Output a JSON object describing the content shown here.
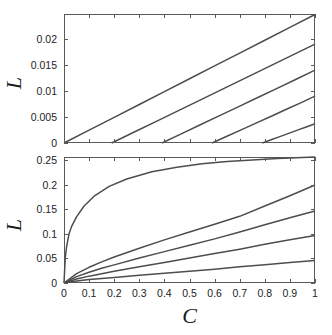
{
  "figure": {
    "title": "",
    "background_color": "#ffffff",
    "curve_color": "#4d4d4d",
    "axis_color": "#5a5a5a"
  },
  "panels": [
    {
      "id": "top",
      "ylabel": "L",
      "xlabel": "",
      "y_ticks": [
        "0",
        "0.005",
        "0.01",
        "0.015",
        "0.02"
      ],
      "x_ticks": [
        "",
        "",
        "",
        "",
        "",
        "",
        "",
        "",
        "",
        "",
        ""
      ],
      "x_tick_labels_visible": false
    },
    {
      "id": "bottom",
      "ylabel": "L",
      "xlabel": "C",
      "y_ticks": [
        "0",
        "0.05",
        "0.1",
        "0.15",
        "0.2",
        "0.25"
      ],
      "x_ticks": [
        "0",
        "0.1",
        "0.2",
        "0.3",
        "0.4",
        "0.5",
        "0.6",
        "0.7",
        "0.8",
        "0.9",
        "1"
      ],
      "x_tick_labels_visible": true
    }
  ],
  "chart_data": [
    {
      "type": "line",
      "panel": "top",
      "title": "",
      "xlabel": "",
      "ylabel": "L",
      "xlim": [
        0,
        1
      ],
      "ylim": [
        0,
        0.0248
      ],
      "grid": false,
      "legend": "none",
      "xticks": [
        0,
        0.1,
        0.2,
        0.3,
        0.4,
        0.5,
        0.6,
        0.7,
        0.8,
        0.9,
        1
      ],
      "yticks": [
        0,
        0.005,
        0.01,
        0.015,
        0.02
      ],
      "ytick_labels": [
        "0",
        "0.005",
        "0.01",
        "0.015",
        "0.02"
      ],
      "series": [
        {
          "name": "curve-1",
          "onset": 0.0,
          "x": [
            0.0,
            0.1,
            0.2,
            0.3,
            0.4,
            0.5,
            0.6,
            0.7,
            0.8,
            0.9,
            1.0
          ],
          "y": [
            0.0,
            0.00247,
            0.00494,
            0.00741,
            0.00988,
            0.01235,
            0.01482,
            0.01729,
            0.01976,
            0.02223,
            0.0247
          ]
        },
        {
          "name": "curve-2",
          "onset": 0.19,
          "x": [
            0.19,
            0.28,
            0.37,
            0.46,
            0.55,
            0.64,
            0.73,
            0.82,
            0.91,
            1.0
          ],
          "y": [
            0.0,
            0.00211,
            0.00422,
            0.00633,
            0.00844,
            0.01056,
            0.01267,
            0.01478,
            0.01689,
            0.019
          ]
        },
        {
          "name": "curve-3",
          "onset": 0.39,
          "x": [
            0.39,
            0.467,
            0.543,
            0.62,
            0.696,
            0.772,
            0.849,
            0.925,
            1.0
          ],
          "y": [
            0.0,
            0.00175,
            0.0035,
            0.00525,
            0.007,
            0.00875,
            0.0105,
            0.01225,
            0.014
          ]
        },
        {
          "name": "curve-4",
          "onset": 0.59,
          "x": [
            0.59,
            0.649,
            0.708,
            0.767,
            0.826,
            0.884,
            0.943,
            1.0
          ],
          "y": [
            0.0,
            0.00129,
            0.00257,
            0.00386,
            0.00514,
            0.00643,
            0.00771,
            0.009
          ]
        },
        {
          "name": "curve-5",
          "onset": 0.79,
          "x": [
            0.79,
            0.825,
            0.86,
            0.895,
            0.93,
            0.965,
            1.0
          ],
          "y": [
            0.0,
            0.00062,
            0.00123,
            0.00185,
            0.00247,
            0.00308,
            0.0037
          ]
        }
      ]
    },
    {
      "type": "line",
      "panel": "bottom",
      "title": "",
      "xlabel": "C",
      "ylabel": "L",
      "xlim": [
        0,
        1
      ],
      "ylim": [
        0,
        0.257
      ],
      "grid": false,
      "legend": "none",
      "xticks": [
        0,
        0.1,
        0.2,
        0.3,
        0.4,
        0.5,
        0.6,
        0.7,
        0.8,
        0.9,
        1
      ],
      "yticks": [
        0,
        0.05,
        0.1,
        0.15,
        0.2,
        0.25
      ],
      "ytick_labels": [
        "0",
        "0.05",
        "0.1",
        "0.15",
        "0.2",
        "0.25"
      ],
      "series": [
        {
          "name": "curve-1",
          "x": [
            0.0,
            0.005,
            0.01,
            0.02,
            0.03,
            0.05,
            0.08,
            0.12,
            0.18,
            0.25,
            0.35,
            0.45,
            0.55,
            0.65,
            0.75,
            0.85,
            0.95,
            1.0
          ],
          "y": [
            0.0,
            0.052,
            0.073,
            0.1,
            0.115,
            0.135,
            0.157,
            0.177,
            0.197,
            0.212,
            0.227,
            0.236,
            0.243,
            0.248,
            0.251,
            0.254,
            0.256,
            0.257
          ]
        },
        {
          "name": "curve-2",
          "x": [
            0.0,
            0.05,
            0.1,
            0.15,
            0.2,
            0.3,
            0.4,
            0.5,
            0.6,
            0.7,
            0.8,
            0.9,
            1.0
          ],
          "y": [
            0.0,
            0.019,
            0.032,
            0.043,
            0.053,
            0.071,
            0.088,
            0.104,
            0.12,
            0.136,
            0.157,
            0.178,
            0.2
          ]
        },
        {
          "name": "curve-3",
          "x": [
            0.0,
            0.05,
            0.1,
            0.15,
            0.2,
            0.3,
            0.4,
            0.5,
            0.6,
            0.7,
            0.8,
            0.9,
            1.0
          ],
          "y": [
            0.0,
            0.013,
            0.022,
            0.03,
            0.037,
            0.051,
            0.064,
            0.077,
            0.09,
            0.104,
            0.119,
            0.133,
            0.147
          ]
        },
        {
          "name": "curve-4",
          "x": [
            0.0,
            0.05,
            0.1,
            0.15,
            0.2,
            0.3,
            0.4,
            0.5,
            0.6,
            0.7,
            0.8,
            0.9,
            1.0
          ],
          "y": [
            0.0,
            0.008,
            0.014,
            0.019,
            0.024,
            0.033,
            0.042,
            0.051,
            0.06,
            0.069,
            0.079,
            0.088,
            0.097
          ]
        },
        {
          "name": "curve-5",
          "x": [
            0.0,
            0.05,
            0.1,
            0.15,
            0.2,
            0.3,
            0.4,
            0.5,
            0.6,
            0.7,
            0.8,
            0.9,
            1.0
          ],
          "y": [
            0.0,
            0.004,
            0.007,
            0.009,
            0.011,
            0.016,
            0.02,
            0.024,
            0.028,
            0.033,
            0.037,
            0.042,
            0.046
          ]
        }
      ]
    }
  ]
}
